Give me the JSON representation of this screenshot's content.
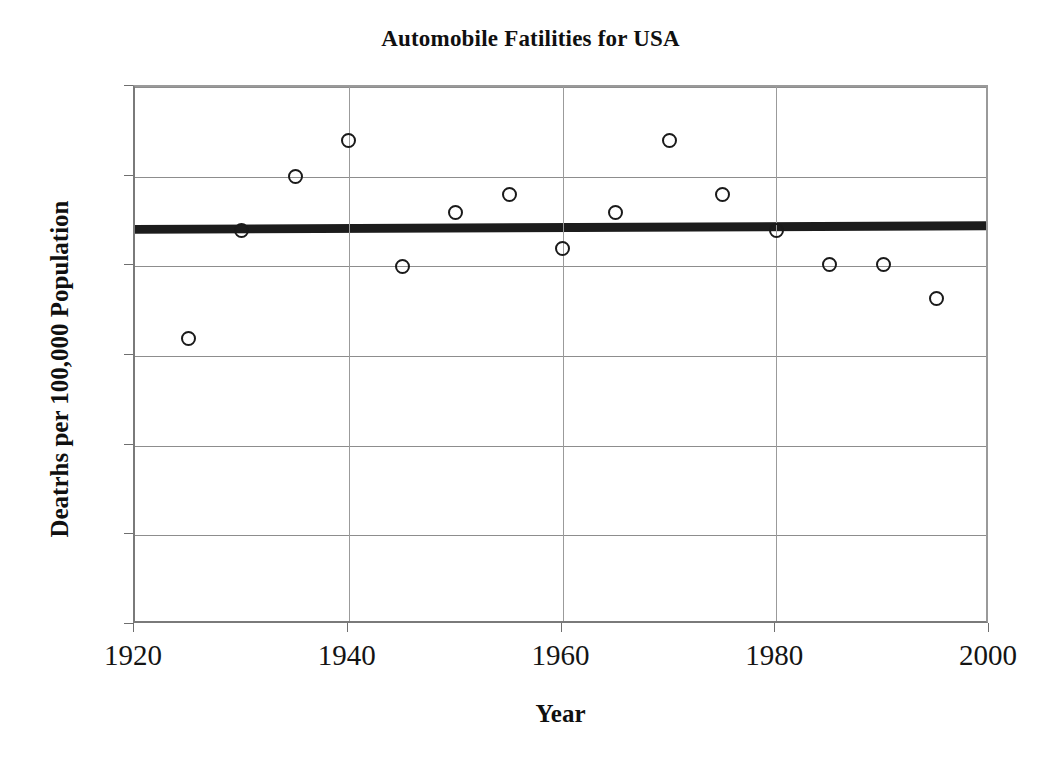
{
  "chart_data": {
    "type": "scatter",
    "title": "Automobile Fatilities for USA",
    "xlabel": "Year",
    "ylabel": "Deatrhs per 100,000 Population",
    "xlim": [
      1920,
      2000
    ],
    "ylim": [
      0,
      30
    ],
    "x_ticks": [
      1920,
      1940,
      1960,
      1980,
      2000
    ],
    "y_ticks": [
      0,
      5,
      10,
      15,
      20,
      25,
      30
    ],
    "grid": "horizontal",
    "legend": "none",
    "marker_style": "open-circle",
    "series": [
      {
        "name": "Automobile Fatalities",
        "x": [
          1925,
          1930,
          1935,
          1940,
          1945,
          1950,
          1955,
          1960,
          1965,
          1970,
          1975,
          1980,
          1985,
          1990,
          1995
        ],
        "values": [
          16,
          22,
          25,
          27,
          20,
          23,
          24,
          21,
          23,
          27,
          24,
          22,
          20.1,
          20.1,
          18.2
        ]
      }
    ],
    "trendline": {
      "name": "Linear trend",
      "x": [
        1920,
        2000
      ],
      "values": [
        22.0,
        22.2
      ],
      "color": "#1c1c1c",
      "width_px": 9
    },
    "colors": {
      "marker_stroke": "#1a1a1a",
      "gridline": "#8d8d8d",
      "axis": "#7a7a7a",
      "text": "#141414",
      "background": "#ffffff"
    }
  }
}
